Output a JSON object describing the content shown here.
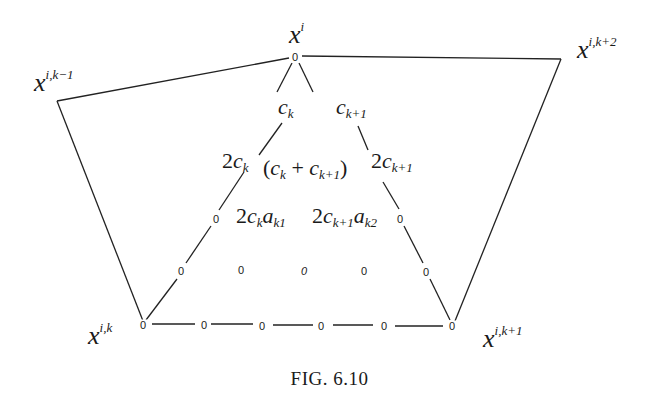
{
  "figure": {
    "caption": "FIG. 6.10"
  },
  "vertices": {
    "top": {
      "base": "x",
      "sup": "i"
    },
    "outer_left": {
      "base": "x",
      "sup": "i,k−1"
    },
    "outer_right": {
      "base": "x",
      "sup": "i,k+2"
    },
    "bottom_left": {
      "base": "x",
      "sup": "i,k"
    },
    "bottom_right": {
      "base": "x",
      "sup": "i,k+1"
    }
  },
  "coefficients": {
    "left_edge_1": {
      "base": "c",
      "sub": "k"
    },
    "right_edge_1": {
      "base": "c",
      "sub": "k+1"
    },
    "left_edge_2": {
      "prefix": "2",
      "base": "c",
      "sub": "k"
    },
    "center_2": {
      "open": "(",
      "base1": "c",
      "sub1": "k",
      "op": " + ",
      "base2": "c",
      "sub2": "k+1",
      "close": ")"
    },
    "right_edge_2": {
      "prefix": "2",
      "base": "c",
      "sub": "k+1"
    },
    "center_3_left": {
      "prefix": "2",
      "base": "c",
      "sub": "k",
      "base2": "a",
      "sub2": "k1"
    },
    "center_3_right": {
      "prefix": "2",
      "base": "c",
      "sub": "k+1",
      "base2": "a",
      "sub2": "k2"
    }
  },
  "zeros": {
    "top": "0",
    "left_edge_3": "0",
    "right_edge_3": "0",
    "left_edge_4": "0",
    "interior_4_a": "0",
    "interior_4_b": "0",
    "interior_4_c": "0",
    "right_edge_4": "0",
    "bottom_left": "0",
    "bottom_1": "0",
    "bottom_2": "0",
    "bottom_3": "0",
    "bottom_4": "0",
    "bottom_right": "0"
  }
}
